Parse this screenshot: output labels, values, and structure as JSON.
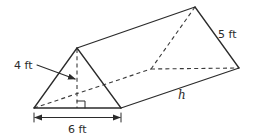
{
  "figure": {
    "type": "triangular-prism"
  },
  "labels": {
    "triangle_height": "4 ft",
    "triangle_base": "6 ft",
    "slant_side": "5 ft",
    "prism_length": "h"
  },
  "colors": {
    "line": "#2b2b2b",
    "background": "#ffffff"
  }
}
